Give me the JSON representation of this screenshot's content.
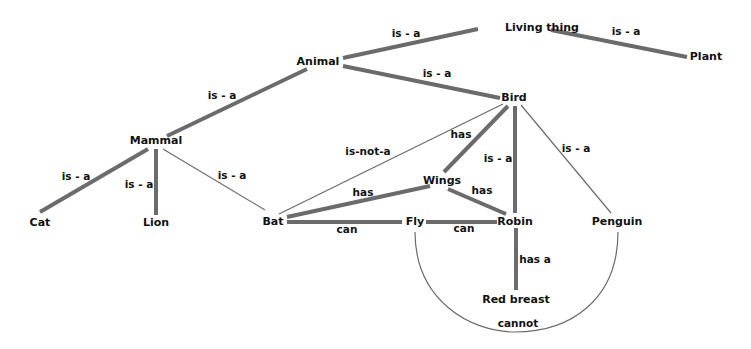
{
  "diagram": {
    "nodes": [
      {
        "id": "living_thing",
        "label": "Living thing",
        "x": 542,
        "y": 31
      },
      {
        "id": "plant",
        "label": "Plant",
        "x": 706,
        "y": 60
      },
      {
        "id": "animal",
        "label": "Animal",
        "x": 318,
        "y": 65
      },
      {
        "id": "bird",
        "label": "Bird",
        "x": 514,
        "y": 101
      },
      {
        "id": "mammal",
        "label": "Mammal",
        "x": 156,
        "y": 144
      },
      {
        "id": "wings",
        "label": "Wings",
        "x": 442,
        "y": 184
      },
      {
        "id": "cat",
        "label": "Cat",
        "x": 40,
        "y": 226
      },
      {
        "id": "lion",
        "label": "Lion",
        "x": 156,
        "y": 226
      },
      {
        "id": "bat",
        "label": "Bat",
        "x": 273,
        "y": 225
      },
      {
        "id": "fly",
        "label": "Fly",
        "x": 415,
        "y": 225
      },
      {
        "id": "robin",
        "label": "Robin",
        "x": 515,
        "y": 225
      },
      {
        "id": "penguin",
        "label": "Penguin",
        "x": 617,
        "y": 225
      },
      {
        "id": "red_breast",
        "label": "Red breast",
        "x": 516,
        "y": 303
      }
    ],
    "edges": [
      {
        "from": "animal",
        "to": "living_thing",
        "label": "is - a",
        "weight": "thick",
        "label_x": 406,
        "label_y": 37
      },
      {
        "from": "plant",
        "to": "living_thing",
        "label": "is - a",
        "weight": "thick",
        "label_x": 626,
        "label_y": 35
      },
      {
        "from": "bird",
        "to": "animal",
        "label": "is - a",
        "weight": "thick",
        "label_x": 437,
        "label_y": 77
      },
      {
        "from": "mammal",
        "to": "animal",
        "label": "is - a",
        "weight": "thick",
        "label_x": 222,
        "label_y": 99
      },
      {
        "from": "cat",
        "to": "mammal",
        "label": "is - a",
        "weight": "thick",
        "label_x": 76,
        "label_y": 180
      },
      {
        "from": "lion",
        "to": "mammal",
        "label": "is - a",
        "weight": "thick",
        "label_x": 139,
        "label_y": 188
      },
      {
        "from": "bat",
        "to": "mammal",
        "label": "is - a",
        "weight": "thin",
        "label_x": 232,
        "label_y": 179
      },
      {
        "from": "bat",
        "to": "bird",
        "label": "is-not-a",
        "weight": "thin",
        "label_x": 368,
        "label_y": 155
      },
      {
        "from": "bird",
        "to": "wings",
        "label": "has",
        "weight": "thick",
        "label_x": 461,
        "label_y": 138
      },
      {
        "from": "robin",
        "to": "bird",
        "label": "is - a",
        "weight": "thick",
        "label_x": 498,
        "label_y": 162
      },
      {
        "from": "penguin",
        "to": "bird",
        "label": "is - a",
        "weight": "thin",
        "label_x": 576,
        "label_y": 152
      },
      {
        "from": "bat",
        "to": "wings",
        "label": "has",
        "weight": "thick",
        "label_x": 363,
        "label_y": 196
      },
      {
        "from": "robin",
        "to": "wings",
        "label": "has",
        "weight": "thick",
        "label_x": 482,
        "label_y": 194
      },
      {
        "from": "bat",
        "to": "fly",
        "label": "can",
        "weight": "thick",
        "label_x": 347,
        "label_y": 233
      },
      {
        "from": "robin",
        "to": "fly",
        "label": "can",
        "weight": "thick",
        "label_x": 464,
        "label_y": 232
      },
      {
        "from": "robin",
        "to": "red_breast",
        "label": "has a",
        "weight": "thick",
        "label_x": 535,
        "label_y": 263
      },
      {
        "from": "penguin",
        "to": "fly",
        "label": "cannot",
        "weight": "thin-arc",
        "label_x": 518,
        "label_y": 327
      }
    ]
  }
}
